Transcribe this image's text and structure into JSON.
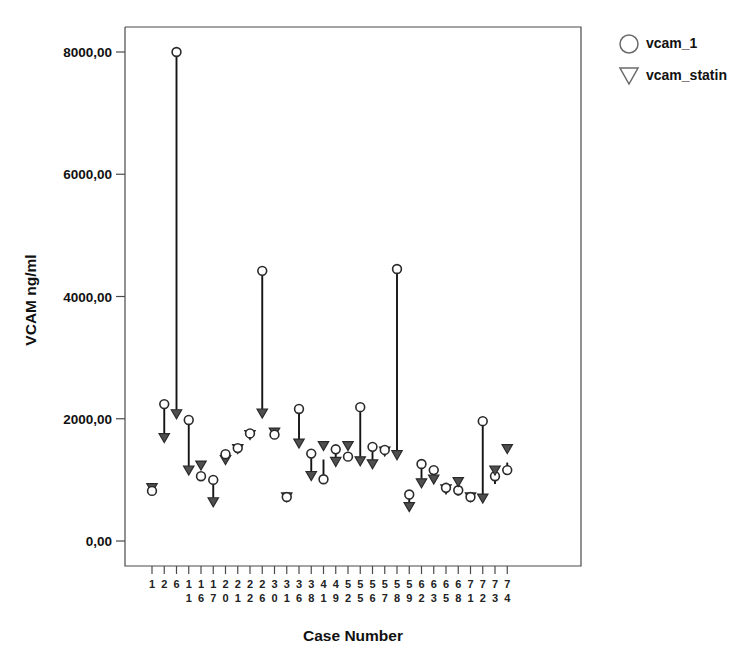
{
  "chart_data": {
    "type": "scatter",
    "title": "",
    "xlabel": "Case Number",
    "ylabel": "VCAM ng/ml",
    "ylim": [
      0,
      8800
    ],
    "yticks": [
      0,
      2000,
      4000,
      6000,
      8000
    ],
    "ytick_labels": [
      "0,00",
      "2000,00",
      "4000,00",
      "6000,00",
      "8000,00"
    ],
    "grid": false,
    "legend_position": "top-right",
    "legend": [
      {
        "name": "vcam_1",
        "marker": "circle"
      },
      {
        "name": "vcam_statin",
        "marker": "triangle-down"
      }
    ],
    "categories": [
      "1",
      "2",
      "6",
      "11",
      "16",
      "17",
      "20",
      "21",
      "22",
      "26",
      "30",
      "31",
      "36",
      "38",
      "41",
      "49",
      "52",
      "55",
      "56",
      "57",
      "58",
      "59",
      "62",
      "63",
      "65",
      "68",
      "71",
      "72",
      "73",
      "74"
    ],
    "x": [
      "1",
      "2",
      "6",
      "11",
      "16",
      "17",
      "20",
      "21",
      "22",
      "26",
      "30",
      "31",
      "36",
      "38",
      "41",
      "49",
      "52",
      "55",
      "56",
      "57",
      "58",
      "59",
      "62",
      "63",
      "65",
      "68",
      "71",
      "72",
      "73",
      "74"
    ],
    "series": [
      {
        "name": "vcam_1",
        "marker": "circle",
        "values": [
          820,
          2240,
          8000,
          1980,
          1060,
          1000,
          1420,
          1520,
          1760,
          4420,
          1740,
          720,
          2160,
          1430,
          1010,
          1500,
          1380,
          2190,
          1540,
          1490,
          4450,
          760,
          1260,
          1160,
          870,
          830,
          720,
          1960,
          1060,
          1160
        ]
      },
      {
        "name": "vcam_statin",
        "marker": "triangle-down",
        "values": [
          790,
          1610,
          2000,
          1080,
          1160,
          560,
          1250,
          1430,
          1660,
          2010,
          1700,
          640,
          1520,
          990,
          1480,
          1220,
          1480,
          1230,
          1180,
          1390,
          1330,
          480,
          870,
          930,
          770,
          890,
          640,
          620,
          1080,
          1430
        ]
      }
    ],
    "pairs": [
      {
        "case": "1",
        "vcam_1": 820,
        "vcam_statin": 790
      },
      {
        "case": "2",
        "vcam_1": 2240,
        "vcam_statin": 1610
      },
      {
        "case": "6",
        "vcam_1": 8000,
        "vcam_statin": 2000
      },
      {
        "case": "11",
        "vcam_1": 1980,
        "vcam_statin": 1080
      },
      {
        "case": "16",
        "vcam_1": 1060,
        "vcam_statin": 1160
      },
      {
        "case": "17",
        "vcam_1": 1000,
        "vcam_statin": 560
      },
      {
        "case": "20",
        "vcam_1": 1420,
        "vcam_statin": 1250
      },
      {
        "case": "21",
        "vcam_1": 1520,
        "vcam_statin": 1430
      },
      {
        "case": "22",
        "vcam_1": 1760,
        "vcam_statin": 1660
      },
      {
        "case": "26",
        "vcam_1": 4420,
        "vcam_statin": 2010
      },
      {
        "case": "30",
        "vcam_1": 1740,
        "vcam_statin": 1700
      },
      {
        "case": "31",
        "vcam_1": 720,
        "vcam_statin": 640
      },
      {
        "case": "36",
        "vcam_1": 2160,
        "vcam_statin": 1520
      },
      {
        "case": "38",
        "vcam_1": 1430,
        "vcam_statin": 990
      },
      {
        "case": "41",
        "vcam_1": 1010,
        "vcam_statin": 1480
      },
      {
        "case": "49",
        "vcam_1": 1500,
        "vcam_statin": 1220
      },
      {
        "case": "52",
        "vcam_1": 1380,
        "vcam_statin": 1480
      },
      {
        "case": "55",
        "vcam_1": 2190,
        "vcam_statin": 1230
      },
      {
        "case": "56",
        "vcam_1": 1540,
        "vcam_statin": 1180
      },
      {
        "case": "57",
        "vcam_1": 1490,
        "vcam_statin": 1390
      },
      {
        "case": "58",
        "vcam_1": 4450,
        "vcam_statin": 1330
      },
      {
        "case": "59",
        "vcam_1": 760,
        "vcam_statin": 480
      },
      {
        "case": "62",
        "vcam_1": 1260,
        "vcam_statin": 870
      },
      {
        "case": "63",
        "vcam_1": 1160,
        "vcam_statin": 930
      },
      {
        "case": "65",
        "vcam_1": 870,
        "vcam_statin": 770
      },
      {
        "case": "68",
        "vcam_1": 830,
        "vcam_statin": 890
      },
      {
        "case": "71",
        "vcam_1": 720,
        "vcam_statin": 640
      },
      {
        "case": "72",
        "vcam_1": 1960,
        "vcam_statin": 620
      },
      {
        "case": "73",
        "vcam_1": 1060,
        "vcam_statin": 1080
      },
      {
        "case": "74",
        "vcam_1": 1160,
        "vcam_statin": 1430
      }
    ],
    "colors": {
      "marker_fill": "#ffffff",
      "marker_edge": "#2a2a2a",
      "triangle_fill": "#4f4f4f",
      "connector": "#141414",
      "axis": "#4a4a4a",
      "text": "#111111",
      "background": "#ffffff"
    }
  }
}
